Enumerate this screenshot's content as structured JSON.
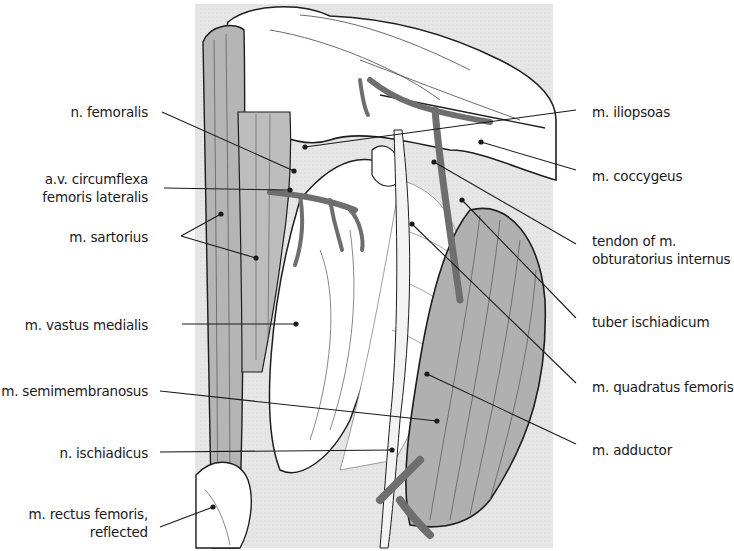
{
  "figure": {
    "background_panel": {
      "x": 195,
      "y": 4,
      "w": 358,
      "h": 544,
      "color": "#e6e6e6"
    },
    "colors": {
      "muscle_gray": "#b3b3b3",
      "muscle_dark": "#8f8f8f",
      "vessel": "#6e6e6e",
      "outline": "#1e1e1e",
      "pale": "#ffffff"
    }
  },
  "labels_left": [
    {
      "id": "n-femoralis",
      "lines": [
        "n. femoralis"
      ],
      "x": 0,
      "right": 148,
      "y": 103,
      "leader": [
        [
          162,
          112
        ],
        [
          294,
          171
        ]
      ]
    },
    {
      "id": "av-circumflexa-femoris-lateralis",
      "lines": [
        "a.v. circumflexa",
        "femoris lateralis"
      ],
      "x": 0,
      "right": 148,
      "y": 170,
      "leader": [
        [
          164,
          188
        ],
        [
          290,
          190
        ]
      ]
    },
    {
      "id": "m-sartorius",
      "lines": [
        "m. sartorius"
      ],
      "x": 0,
      "right": 148,
      "y": 228,
      "leader": [
        [
          181,
          236
        ],
        [
          221,
          214
        ]
      ],
      "leader2": [
        [
          181,
          236
        ],
        [
          256,
          258
        ]
      ]
    },
    {
      "id": "m-vastus-medialis",
      "lines": [
        "m. vastus medialis"
      ],
      "x": 0,
      "right": 148,
      "y": 316,
      "leader": [
        [
          182,
          324
        ],
        [
          296,
          324
        ]
      ]
    },
    {
      "id": "m-semimembranosus",
      "lines": [
        "m. semimembranosus"
      ],
      "x": 0,
      "right": 148,
      "y": 382,
      "leader": [
        [
          160,
          391
        ],
        [
          437,
          421
        ]
      ]
    },
    {
      "id": "n-ischiadicus",
      "lines": [
        "n. ischiadicus"
      ],
      "x": 0,
      "right": 148,
      "y": 444,
      "leader": [
        [
          160,
          452
        ],
        [
          392,
          450
        ]
      ]
    },
    {
      "id": "m-rectus-femoris-reflected",
      "lines": [
        "m. rectus femoris,",
        "reflected"
      ],
      "x": 0,
      "right": 148,
      "y": 505,
      "leader": [
        [
          160,
          527
        ],
        [
          213,
          507
        ]
      ]
    }
  ],
  "labels_right": [
    {
      "id": "m-iliopsoas",
      "lines": [
        "m. iliopsoas"
      ],
      "x": 592,
      "y": 103,
      "leader": [
        [
          576,
          110
        ],
        [
          305,
          147
        ]
      ]
    },
    {
      "id": "m-coccygeus",
      "lines": [
        "m. coccygeus"
      ],
      "x": 592,
      "y": 167,
      "leader": [
        [
          576,
          170
        ],
        [
          481,
          142
        ]
      ]
    },
    {
      "id": "tendon-of-m-obturatorius-internus",
      "lines": [
        "tendon of m.",
        "obturatorius internus"
      ],
      "x": 592,
      "y": 232,
      "leader": [
        [
          576,
          244
        ],
        [
          434,
          162
        ]
      ]
    },
    {
      "id": "tuber-ischiadicum",
      "lines": [
        "tuber ischiadicum"
      ],
      "x": 592,
      "y": 313,
      "leader": [
        [
          576,
          318
        ],
        [
          462,
          200
        ]
      ]
    },
    {
      "id": "m-quadratus-femoris",
      "lines": [
        "m. quadratus femoris"
      ],
      "x": 592,
      "y": 378,
      "leader": [
        [
          576,
          383
        ],
        [
          412,
          224
        ]
      ]
    },
    {
      "id": "m-adductor",
      "lines": [
        "m. adductor"
      ],
      "x": 592,
      "y": 441,
      "leader": [
        [
          576,
          444
        ],
        [
          427,
          374
        ]
      ]
    }
  ]
}
